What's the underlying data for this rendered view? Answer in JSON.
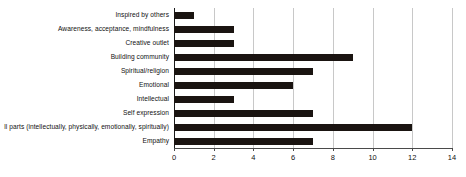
{
  "chart_data": {
    "type": "bar",
    "orientation": "horizontal",
    "title": "",
    "subtitle": "",
    "xlabel": "",
    "ylabel": "",
    "categories": [
      "Inspired by others",
      "Awareness, acceptance, mindfulness",
      "Creative outlet",
      "Building community",
      "Spiritual/religion",
      "Emotional",
      "Intellectual",
      "Self expression",
      "ll parts (intellectually, physically, emotionally, spiritually)",
      "Empathy"
    ],
    "values": [
      1,
      3,
      3,
      9,
      7,
      6,
      3,
      7,
      12,
      7
    ],
    "xlim": [
      0,
      14
    ],
    "xticks": [
      0,
      2,
      4,
      6,
      8,
      10,
      12,
      14
    ],
    "xtick_labels": [
      "0",
      "2",
      "4",
      "6",
      "8",
      "10",
      "12",
      "14"
    ],
    "grid": true,
    "grid_axis": "x",
    "legend": false,
    "legend_position": "none",
    "colors": {
      "bar": "#1a1411",
      "gridline": "#c8c8c8",
      "axis": "#4a4a4a",
      "text": "#111111",
      "background": "#ffffff"
    }
  }
}
